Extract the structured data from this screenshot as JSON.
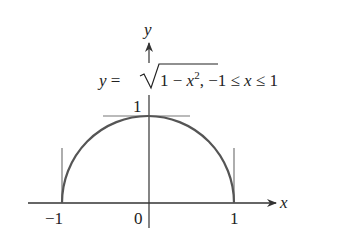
{
  "diagram": {
    "type": "function-graph",
    "function_label": {
      "prefix": "y = ",
      "radicand": "1 − x",
      "exponent": "2",
      "domain": ", −1 ≤ x ≤ 1"
    },
    "axes": {
      "x_label": "x",
      "y_label": "y"
    },
    "ticks": {
      "x_neg_one": "−1",
      "origin": "0",
      "x_one": "1",
      "y_one": "1"
    },
    "colors": {
      "curve": "#555555",
      "axes": "#333333",
      "tangents": "#777777",
      "text": "#222222"
    }
  }
}
